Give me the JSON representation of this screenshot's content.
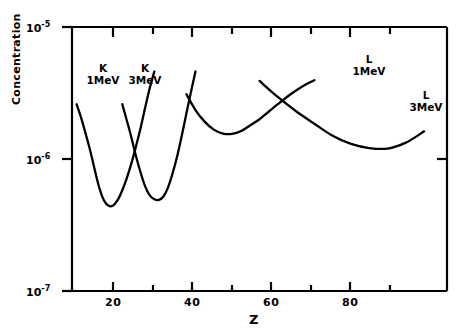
{
  "chart_data": {
    "type": "line",
    "title": "",
    "xlabel": "Z",
    "ylabel": "Concentration",
    "yscale": "log",
    "xlim": [
      13,
      95
    ],
    "ylim": [
      1e-07,
      1e-05
    ],
    "grid": false,
    "legend": "inline-annotations",
    "ytick_labels": [
      "10-5",
      "10-6",
      "10-7"
    ],
    "ytick_values": [
      1e-05,
      1e-06,
      1e-07
    ],
    "ytick_mantissa": "10",
    "ytick_exponents": [
      "-5",
      "-6",
      "-7"
    ],
    "xtick_labels": [
      "20",
      "40",
      "60",
      "80"
    ],
    "xtick_values": [
      20,
      40,
      60,
      80
    ],
    "xminor_values": [
      30,
      50,
      70,
      90
    ],
    "series": [
      {
        "name": "K 1MeV",
        "label_line1": "K",
        "label_line2": "1MeV",
        "minimum_z": 21,
        "minimum_value": 4.4e-07,
        "x": [
          14,
          15,
          16,
          17,
          18,
          19,
          20,
          21,
          22,
          23,
          24,
          25,
          26,
          27,
          28,
          29,
          30,
          31
        ],
        "y": [
          2.6e-06,
          2.05e-06,
          1.55e-06,
          1.15e-06,
          8.2e-07,
          6e-07,
          4.85e-07,
          4.42e-07,
          4.45e-07,
          4.9e-07,
          5.8e-07,
          7.2e-07,
          9.3e-07,
          1.25e-06,
          1.72e-06,
          2.45e-06,
          3.45e-06,
          4.6e-06
        ]
      },
      {
        "name": "K 3MeV",
        "label_line1": "K",
        "label_line2": "3MeV",
        "minimum_z": 32,
        "minimum_value": 4.9e-07,
        "x": [
          24,
          25,
          26,
          27,
          28,
          29,
          30,
          31,
          32,
          33,
          34,
          35,
          36,
          37,
          38,
          39,
          40
        ],
        "y": [
          2.6e-06,
          1.95e-06,
          1.45e-06,
          1.05e-06,
          7.9e-07,
          6.2e-07,
          5.3e-07,
          4.95e-07,
          4.9e-07,
          5.2e-07,
          6.1e-07,
          7.8e-07,
          1.05e-06,
          1.5e-06,
          2.2e-06,
          3.2e-06,
          4.6e-06
        ]
      },
      {
        "name": "L 1MeV",
        "label_line1": "L",
        "label_line2": "1MeV",
        "minimum_z": 47,
        "minimum_value": 1.55e-06,
        "x": [
          38,
          40,
          42,
          44,
          46,
          48,
          50,
          52,
          54,
          56,
          58,
          60,
          62,
          64,
          66
        ],
        "y": [
          3.1e-06,
          2.35e-06,
          1.92e-06,
          1.67e-06,
          1.56e-06,
          1.55e-06,
          1.63e-06,
          1.8e-06,
          2e-06,
          2.28e-06,
          2.6e-06,
          2.95e-06,
          3.3e-06,
          3.65e-06,
          3.95e-06
        ]
      },
      {
        "name": "L 3MeV",
        "label_line1": "L",
        "label_line2": "3MeV",
        "minimum_z": 81,
        "minimum_value": 1.2e-06,
        "x": [
          54,
          58,
          62,
          66,
          70,
          74,
          78,
          82,
          86,
          90
        ],
        "y": [
          3.9e-06,
          2.95e-06,
          2.3e-06,
          1.85e-06,
          1.5e-06,
          1.3e-06,
          1.21e-06,
          1.2e-06,
          1.33e-06,
          1.62e-06
        ]
      }
    ],
    "annotations": [
      {
        "text": "K 1MeV",
        "z": 17.5
      },
      {
        "text": "K 3MeV",
        "z": 27.5
      },
      {
        "text": "L 1MeV",
        "z": 68
      },
      {
        "text": "L 3MeV",
        "z": 90
      }
    ]
  },
  "axis": {
    "y_top": "10",
    "y_top_exp": "-5",
    "y_mid": "10",
    "y_mid_exp": "-6",
    "y_bot": "10",
    "y_bot_exp": "-7",
    "x_title": "Z",
    "y_title": "Concentration"
  },
  "labels": {
    "k1_l1": "K",
    "k1_l2": "1MeV",
    "k3_l1": "K",
    "k3_l2": "3MeV",
    "l1_l1": "L",
    "l1_l2": "1MeV",
    "l3_l1": "L",
    "l3_l2": "3MeV"
  },
  "colors": {
    "ink": "#000000",
    "paper": "#ffffff"
  },
  "xticks": [
    "20",
    "40",
    "60",
    "80"
  ]
}
